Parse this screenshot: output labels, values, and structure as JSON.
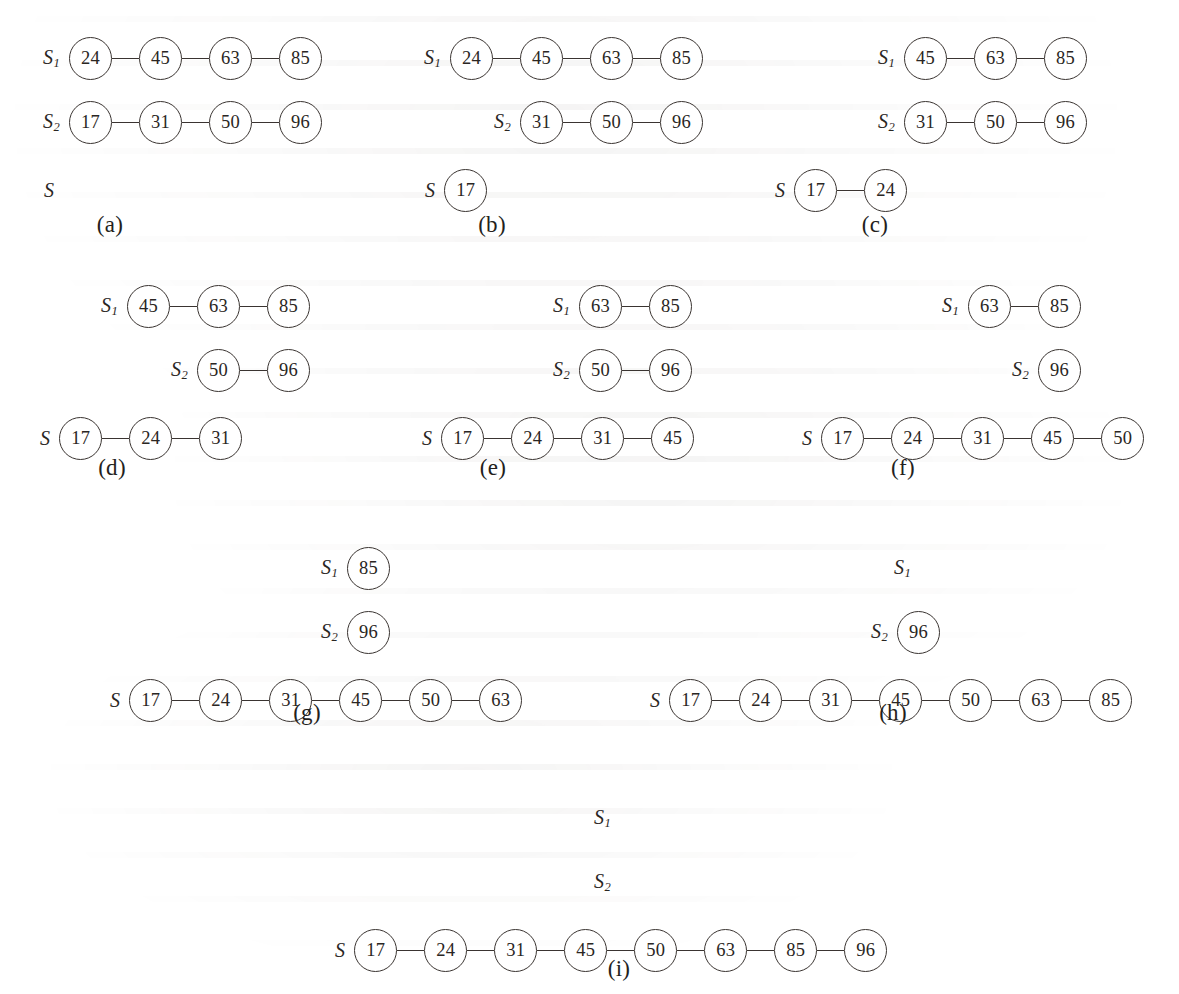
{
  "figure": {
    "kind": "merge-of-two-sorted-lists-step-sequence",
    "labels": {
      "s1": "S",
      "s1_sub": "1",
      "s2": "S",
      "s2_sub": "2",
      "s": "S"
    },
    "node_values_all": [
      17,
      24,
      31,
      45,
      50,
      63,
      85,
      96
    ],
    "colors": {
      "ink": "#2a2623",
      "stroke": "#3a3431",
      "paper": "#ffffff"
    }
  },
  "panels": [
    {
      "id": "a",
      "caption": "(a)",
      "s1": {
        "label": "S",
        "sub": "1",
        "values": [
          24,
          45,
          63,
          85
        ]
      },
      "s2": {
        "label": "S",
        "sub": "2",
        "values": [
          17,
          31,
          50,
          96
        ]
      },
      "s": {
        "label": "S",
        "sub": "",
        "values": []
      }
    },
    {
      "id": "b",
      "caption": "(b)",
      "s1": {
        "label": "S",
        "sub": "1",
        "values": [
          24,
          45,
          63,
          85
        ]
      },
      "s2": {
        "label": "S",
        "sub": "2",
        "values": [
          31,
          50,
          96
        ]
      },
      "s": {
        "label": "S",
        "sub": "",
        "values": [
          17
        ]
      }
    },
    {
      "id": "c",
      "caption": "(c)",
      "s1": {
        "label": "S",
        "sub": "1",
        "values": [
          45,
          63,
          85
        ]
      },
      "s2": {
        "label": "S",
        "sub": "2",
        "values": [
          31,
          50,
          96
        ]
      },
      "s": {
        "label": "S",
        "sub": "",
        "values": [
          17,
          24
        ]
      }
    },
    {
      "id": "d",
      "caption": "(d)",
      "s1": {
        "label": "S",
        "sub": "1",
        "values": [
          45,
          63,
          85
        ]
      },
      "s2": {
        "label": "S",
        "sub": "2",
        "values": [
          50,
          96
        ]
      },
      "s": {
        "label": "S",
        "sub": "",
        "values": [
          17,
          24,
          31
        ]
      }
    },
    {
      "id": "e",
      "caption": "(e)",
      "s1": {
        "label": "S",
        "sub": "1",
        "values": [
          63,
          85
        ]
      },
      "s2": {
        "label": "S",
        "sub": "2",
        "values": [
          50,
          96
        ]
      },
      "s": {
        "label": "S",
        "sub": "",
        "values": [
          17,
          24,
          31,
          45
        ]
      }
    },
    {
      "id": "f",
      "caption": "(f)",
      "s1": {
        "label": "S",
        "sub": "1",
        "values": [
          63,
          85
        ]
      },
      "s2": {
        "label": "S",
        "sub": "2",
        "values": [
          96
        ]
      },
      "s": {
        "label": "S",
        "sub": "",
        "values": [
          17,
          24,
          31,
          45,
          50
        ]
      }
    },
    {
      "id": "g",
      "caption": "(g)",
      "s1": {
        "label": "S",
        "sub": "1",
        "values": [
          85
        ]
      },
      "s2": {
        "label": "S",
        "sub": "2",
        "values": [
          96
        ]
      },
      "s": {
        "label": "S",
        "sub": "",
        "values": [
          17,
          24,
          31,
          45,
          50,
          63
        ]
      }
    },
    {
      "id": "h",
      "caption": "(h)",
      "s1": {
        "label": "S",
        "sub": "1",
        "values": []
      },
      "s2": {
        "label": "S",
        "sub": "2",
        "values": [
          96
        ]
      },
      "s": {
        "label": "S",
        "sub": "",
        "values": [
          17,
          24,
          31,
          45,
          50,
          63,
          85
        ]
      }
    },
    {
      "id": "i",
      "caption": "(i)",
      "s1": {
        "label": "S",
        "sub": "1",
        "values": []
      },
      "s2": {
        "label": "S",
        "sub": "2",
        "values": []
      },
      "s": {
        "label": "S",
        "sub": "",
        "values": [
          17,
          24,
          31,
          45,
          50,
          63,
          85,
          96
        ]
      }
    }
  ],
  "layout": {
    "panel_origins": [
      {
        "id": "a",
        "x": 0,
        "y": 0,
        "s1_right": 322,
        "s2_right": 322,
        "s_left": 74,
        "cap_x": 110,
        "cap_y": 212
      },
      {
        "id": "b",
        "x": 0,
        "y": 0,
        "s1_right": 703,
        "s2_right": 703,
        "s_left": 455,
        "cap_x": 492,
        "cap_y": 212
      },
      {
        "id": "c",
        "x": 0,
        "y": 0,
        "s1_right": 1087,
        "s2_right": 1087,
        "s_left": 805,
        "cap_x": 875,
        "cap_y": 212
      },
      {
        "id": "d",
        "x": 0,
        "y": 248,
        "s1_right": 310,
        "s2_right": 310,
        "s_left": 70,
        "cap_x": 112,
        "cap_y": 207
      },
      {
        "id": "e",
        "x": 0,
        "y": 248,
        "s1_right": 692,
        "s2_right": 692,
        "s_left": 452,
        "cap_x": 493,
        "cap_y": 207
      },
      {
        "id": "f",
        "x": 0,
        "y": 248,
        "s1_right": 1081,
        "s2_right": 1081,
        "s_left": 832,
        "cap_x": 903,
        "cap_y": 207
      },
      {
        "id": "g",
        "x": 0,
        "y": 510,
        "s1_right": 390,
        "s2_right": 390,
        "s_left": 140,
        "cap_x": 307,
        "cap_y": 190
      },
      {
        "id": "h",
        "x": 0,
        "y": 510,
        "s1_right": 920,
        "s2_right": 940,
        "s_left": 680,
        "cap_x": 893,
        "cap_y": 190
      },
      {
        "id": "i",
        "x": 0,
        "y": 760,
        "s1_right": 620,
        "s2_right": 620,
        "s_left": 365,
        "cap_x": 619,
        "cap_y": 196
      }
    ],
    "row_y": {
      "s1": 36,
      "s2": 100,
      "s": 168
    },
    "node_diameter": 43,
    "link_width": 27
  }
}
